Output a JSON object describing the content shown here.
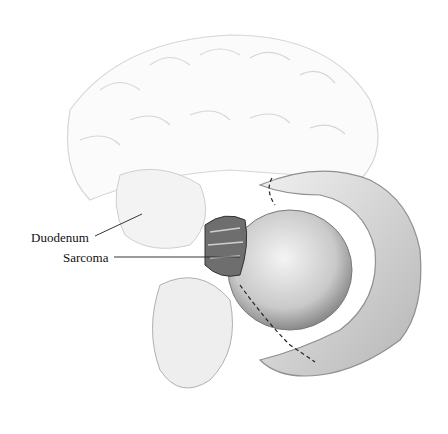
{
  "figure": {
    "labels": [
      {
        "id": "duodenum",
        "text": "Duodenum"
      },
      {
        "id": "sarcoma",
        "text": "Sarcoma"
      }
    ]
  }
}
